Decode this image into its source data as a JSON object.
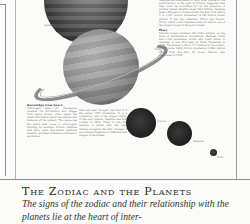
{
  "illustration": {
    "planets": [
      {
        "name": "Jupiter",
        "label": "Jupiter"
      },
      {
        "name": "Saturn",
        "label": "Saturn"
      },
      {
        "name": "Uranus",
        "label": "Uranus"
      },
      {
        "name": "Neptune",
        "label": "Neptune"
      },
      {
        "name": "Pluto",
        "label": "Pluto"
      }
    ]
  },
  "columns": {
    "right": {
      "intro": "Neptune was discovered in 1846, after studies of the perturbations of the path of Uranus suggested that they could be accounted for by the presence of another planet. Slightly larger than Uranus, Neptune takes 165 years to travel around the Sun, from which it is 4,497 million kilometres (2,796 million miles) distant. It has two satellites, Triton and Nereid. Triton, which orbits Neptune every six days is one of the largest moons in the solar system.",
      "pluto_heading": "Pluto",
      "pluto_text": "Percival Lowell assumed that Pluto existed, on the basis of mathematical calculations. Between 2,200 and 4,400 kilometres (2,000 and 3,000 miles) in diameter, it was first seen by Clyde Tombaugh in 1930. The planet's orbit is 17° inclined to the ecliptic, and is some 5,800 million kilometres (3,660 million miles) from the Sun. Its moon, Charon, was discovered in 1978."
    },
    "left_1": {
      "heading": "Knowledge from Space",
      "text": "Astrologers take our intelligence received via information and images from space probes, often reveal the latest information about the physics and make-up of the planets. The space age has given new scope to astrological thinking, for example, Uranus, Neptune and Pluto were discovered relatively recently, and their influence continues to be studied."
    },
    "left_2": {
      "text": "than was ever thought, and that it is the planet 4997 kilometres. It is a companion, and is the subject matter of the solar system. Neptune was first located in 1846. There is also the satellite, a planet that has been studied alongside the Sun. Voyager 2 encountered Neptune in 1989 and sent images of the system."
    }
  },
  "heading": {
    "title": "The Zodiac and the Planets",
    "subtitle": "The signs of the zodiac and their relationship with the planets lie at the heart of inter-"
  }
}
